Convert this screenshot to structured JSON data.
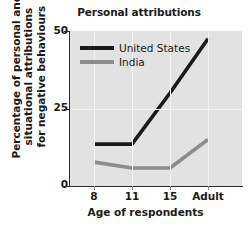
{
  "chart_data": {
    "type": "line",
    "title": "Personal attributions",
    "xlabel": "Age of respondents",
    "ylabel": "Percentage of personal and situational attributions for negative behaviours",
    "ylabel_lines": [
      "Percentage of personal and",
      "situational attributions",
      "for negative behaviours"
    ],
    "categories": [
      "8",
      "11",
      "15",
      "Adult"
    ],
    "yticks": [
      "0",
      "25",
      "50"
    ],
    "ytick_values": [
      0,
      25,
      50
    ],
    "ylim": [
      0,
      50
    ],
    "grid": true,
    "legend_position": "top-left-inside",
    "series": [
      {
        "name": "United States",
        "color": "#1a1a1a",
        "values": [
          13.5,
          13.5,
          30.0,
          47.5
        ]
      },
      {
        "name": "India",
        "color": "#8c8c8c",
        "values": [
          7.7,
          5.8,
          5.8,
          15.0
        ]
      }
    ]
  },
  "colors": {
    "plot_background": "#e2e2e2",
    "gridline": "#f4f4f4",
    "axis": "#2b2b2b",
    "page_background": "#ffffff",
    "united_states": "#1a1a1a",
    "india": "#8c8c8c"
  }
}
